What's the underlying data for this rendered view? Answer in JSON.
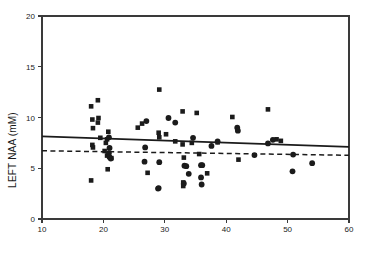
{
  "chart_data": {
    "type": "scatter",
    "title": "",
    "xlabel": "",
    "ylabel": "LEFT NAA (mM)",
    "xlim": [
      10,
      60
    ],
    "ylim": [
      0,
      20
    ],
    "xticks": [
      10,
      20,
      30,
      40,
      50,
      60
    ],
    "yticks": [
      0,
      5,
      10,
      15,
      20
    ],
    "xtick_labels": [
      "10",
      "20",
      "30",
      "40",
      "50",
      "60"
    ],
    "ytick_labels": [
      "0",
      "5",
      "10",
      "15",
      "20"
    ],
    "grid": false,
    "legend": null,
    "legend_position": "none",
    "marker_color": "#1b1b1b",
    "series": [
      {
        "name": "squares",
        "marker": "square",
        "color": "#1b1b1b",
        "points": [
          [
            18.0,
            11.1
          ],
          [
            19.1,
            11.7
          ],
          [
            18.2,
            9.8
          ],
          [
            19.2,
            9.95
          ],
          [
            19.1,
            9.5
          ],
          [
            18.3,
            8.95
          ],
          [
            18.2,
            7.3
          ],
          [
            18.3,
            7.05
          ],
          [
            19.5,
            8.0
          ],
          [
            20.8,
            8.6
          ],
          [
            20.6,
            7.85
          ],
          [
            20.4,
            7.5
          ],
          [
            20.2,
            6.7
          ],
          [
            20.6,
            6.25
          ],
          [
            21.3,
            6.0
          ],
          [
            20.7,
            4.9
          ],
          [
            18.0,
            3.8
          ],
          [
            25.6,
            9.0
          ],
          [
            26.3,
            9.4
          ],
          [
            29.1,
            12.75
          ],
          [
            29.0,
            8.5
          ],
          [
            29.1,
            8.05
          ],
          [
            30.2,
            8.35
          ],
          [
            31.7,
            7.65
          ],
          [
            32.9,
            10.6
          ],
          [
            32.9,
            7.35
          ],
          [
            33.1,
            6.05
          ],
          [
            33.0,
            3.6
          ],
          [
            33.0,
            3.25
          ],
          [
            35.2,
            10.45
          ],
          [
            34.4,
            7.5
          ],
          [
            35.6,
            6.4
          ],
          [
            36.9,
            4.5
          ],
          [
            38.6,
            7.55
          ],
          [
            41.0,
            10.05
          ],
          [
            42.0,
            5.85
          ],
          [
            46.8,
            10.8
          ],
          [
            48.2,
            7.85
          ],
          [
            48.9,
            7.7
          ],
          [
            27.2,
            4.55
          ]
        ]
      },
      {
        "name": "circles",
        "marker": "circle",
        "color": "#1b1b1b",
        "points": [
          [
            20.9,
            6.5
          ],
          [
            21.0,
            6.1
          ],
          [
            21.2,
            5.95
          ],
          [
            27.0,
            9.65
          ],
          [
            26.8,
            7.05
          ],
          [
            26.7,
            5.65
          ],
          [
            29.1,
            5.6
          ],
          [
            28.9,
            3.0
          ],
          [
            29.0,
            3.05
          ],
          [
            30.6,
            9.95
          ],
          [
            31.7,
            9.5
          ],
          [
            33.2,
            5.25
          ],
          [
            33.5,
            5.2
          ],
          [
            33.1,
            3.5
          ],
          [
            33.9,
            4.45
          ],
          [
            34.6,
            8.0
          ],
          [
            35.9,
            5.3
          ],
          [
            36.1,
            5.3
          ],
          [
            35.9,
            4.1
          ],
          [
            36.0,
            3.4
          ],
          [
            37.6,
            7.2
          ],
          [
            38.6,
            7.65
          ],
          [
            41.8,
            9.0
          ],
          [
            41.9,
            8.7
          ],
          [
            44.6,
            6.3
          ],
          [
            46.8,
            7.45
          ],
          [
            47.6,
            7.8
          ],
          [
            50.9,
            6.35
          ],
          [
            50.8,
            4.7
          ],
          [
            54.0,
            5.5
          ],
          [
            21.0,
            7.0
          ],
          [
            20.9,
            8.05
          ]
        ]
      }
    ],
    "fit_lines": [
      {
        "name": "solid-regression-line",
        "style": "solid",
        "color": "#1b1b1b",
        "x": [
          10,
          60
        ],
        "y": [
          8.15,
          7.1
        ]
      },
      {
        "name": "dashed-regression-line",
        "style": "dashed",
        "color": "#1b1b1b",
        "x": [
          10,
          60
        ],
        "y": [
          6.72,
          6.28
        ]
      }
    ]
  }
}
